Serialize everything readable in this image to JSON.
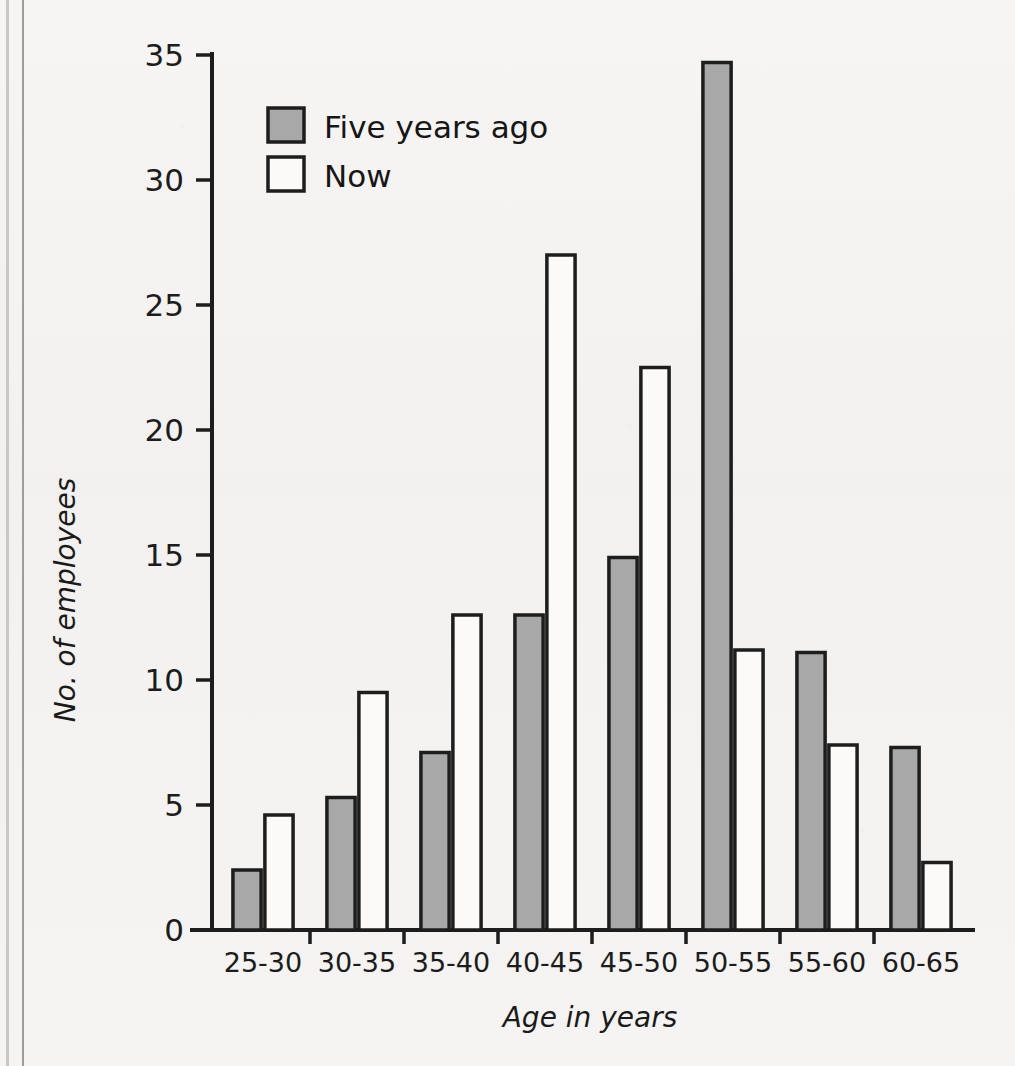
{
  "chart_data": {
    "type": "bar",
    "title": "",
    "xlabel": "Age in years",
    "ylabel": "No. of employees",
    "categories": [
      "25-30",
      "30-35",
      "35-40",
      "40-45",
      "45-50",
      "50-55",
      "55-60",
      "60-65"
    ],
    "series": [
      {
        "name": "Five years ago",
        "color": "#a8a8a8",
        "values": [
          2.4,
          5.3,
          7.1,
          12.6,
          14.9,
          34.7,
          11.1,
          7.3
        ]
      },
      {
        "name": "Now",
        "color": "#ffffff",
        "values": [
          4.6,
          9.5,
          12.6,
          27.0,
          22.5,
          11.2,
          7.4,
          2.7
        ]
      }
    ],
    "ylim": [
      0,
      36
    ],
    "yticks": [
      0,
      5,
      10,
      15,
      20,
      25,
      30,
      35
    ],
    "ytick_labels": [
      "0",
      "5",
      "10",
      "15",
      "20",
      "25",
      "30",
      "35"
    ],
    "grid": false,
    "legend_position": "top-left-inside"
  },
  "legend": {
    "entries": [
      {
        "label": "Five years ago",
        "swatch": "gray-filled-square"
      },
      {
        "label": "Now",
        "swatch": "white-outlined-square"
      }
    ]
  },
  "axes": {
    "y_axis_title": "No. of employees",
    "x_axis_title": "Age in years"
  },
  "colors": {
    "bar_gray": "#a8a8a8",
    "bar_white": "#fbfaf8",
    "outline": "#1d1d1d",
    "page_background": "#f4f3f1"
  }
}
